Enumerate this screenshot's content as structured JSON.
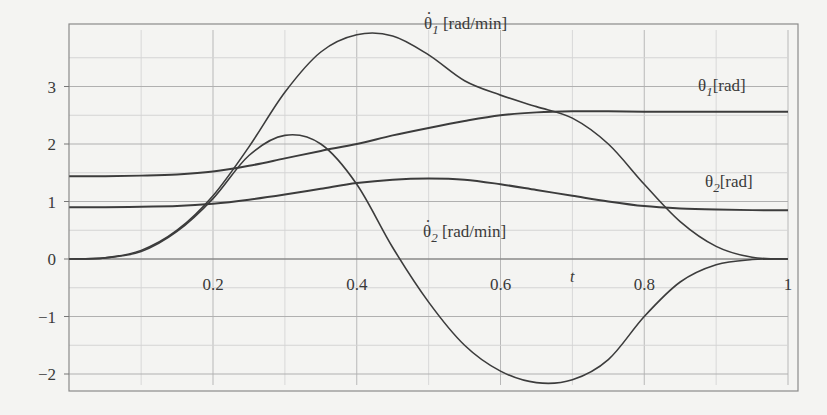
{
  "chart_data": {
    "type": "line",
    "title": "",
    "xlabel": "t",
    "ylabel": "",
    "xlim": [
      0,
      1
    ],
    "ylim": [
      -2.3,
      4.0
    ],
    "grid": true,
    "legend_position": "inline labels",
    "x_ticks": [
      "0.2",
      "0.4",
      "0.6",
      "0.8",
      "1"
    ],
    "y_ticks": [
      "-2",
      "-1",
      "0",
      "1",
      "2",
      "3"
    ],
    "x": [
      0,
      0.05,
      0.1,
      0.15,
      0.2,
      0.25,
      0.3,
      0.35,
      0.4,
      0.45,
      0.5,
      0.55,
      0.6,
      0.65,
      0.7,
      0.75,
      0.8,
      0.85,
      0.9,
      0.95,
      1.0
    ],
    "series": [
      {
        "name": "θ̇1 [rad/min]",
        "label_base": "θ",
        "label_sub": "1",
        "label_unit": "[rad/min]",
        "dotted": true,
        "values": [
          0,
          0.02,
          0.15,
          0.5,
          1.1,
          1.95,
          2.9,
          3.6,
          3.9,
          3.88,
          3.55,
          3.1,
          2.85,
          2.65,
          2.45,
          2.0,
          1.3,
          0.65,
          0.22,
          0.03,
          0
        ]
      },
      {
        "name": "θ1 [rad]",
        "label_base": "θ",
        "label_sub": "1",
        "label_unit": "[rad]",
        "dotted": false,
        "values": [
          1.44,
          1.44,
          1.45,
          1.47,
          1.52,
          1.62,
          1.75,
          1.88,
          2.0,
          2.15,
          2.28,
          2.4,
          2.5,
          2.55,
          2.57,
          2.57,
          2.56,
          2.56,
          2.56,
          2.56,
          2.56
        ]
      },
      {
        "name": "θ̇2 [rad/min]",
        "label_base": "θ",
        "label_sub": "2",
        "label_unit": "[rad/min]",
        "dotted": true,
        "values": [
          0,
          0.02,
          0.13,
          0.48,
          1.05,
          1.8,
          2.15,
          2.0,
          1.3,
          0.2,
          -0.75,
          -1.5,
          -1.95,
          -2.15,
          -2.1,
          -1.75,
          -1.0,
          -0.4,
          -0.1,
          -0.01,
          0
        ]
      },
      {
        "name": "θ2 [rad]",
        "label_base": "θ",
        "label_sub": "2",
        "label_unit": "[rad]",
        "dotted": false,
        "values": [
          0.9,
          0.9,
          0.91,
          0.92,
          0.96,
          1.03,
          1.12,
          1.22,
          1.32,
          1.38,
          1.4,
          1.38,
          1.3,
          1.2,
          1.1,
          1.0,
          0.92,
          0.88,
          0.86,
          0.85,
          0.85
        ]
      }
    ]
  },
  "labels": {
    "s0": {
      "base": "θ",
      "sub": "1",
      "unit": "[rad/min]"
    },
    "s1": {
      "base": "θ",
      "sub": "1",
      "unit": "[rad]"
    },
    "s2": {
      "base": "θ",
      "sub": "2",
      "unit": "[rad/min]"
    },
    "s3": {
      "base": "θ",
      "sub": "2",
      "unit": "[rad]"
    },
    "t_axis": "t"
  }
}
